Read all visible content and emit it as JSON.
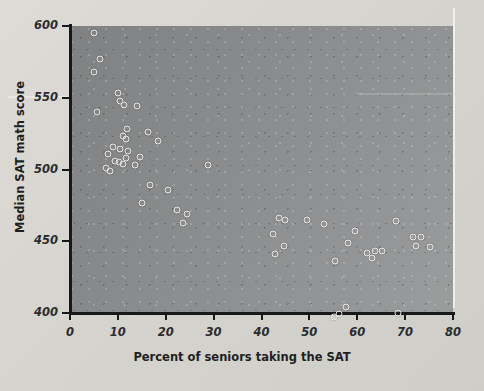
{
  "chart_data": {
    "type": "scatter",
    "title": "",
    "xlabel": "Percent of seniors taking the SAT",
    "ylabel": "Median SAT math score",
    "xlim": [
      0,
      80
    ],
    "ylim": [
      385,
      600
    ],
    "xticks": [
      0,
      10,
      20,
      30,
      40,
      50,
      60,
      70,
      80
    ],
    "yticks": [
      400,
      450,
      500,
      550,
      600
    ],
    "grid": false,
    "legend": null,
    "marker": "open-circle",
    "marker_color": "#eceae4",
    "plot_background": "#8b8d8e",
    "page_background": "#d9d9d6",
    "axis_color": "#16181a",
    "points": [
      {
        "x": 5.0,
        "y": 595
      },
      {
        "x": 6.3,
        "y": 577
      },
      {
        "x": 5.1,
        "y": 568
      },
      {
        "x": 10.0,
        "y": 553
      },
      {
        "x": 10.4,
        "y": 548
      },
      {
        "x": 11.2,
        "y": 545
      },
      {
        "x": 14.0,
        "y": 544
      },
      {
        "x": 5.6,
        "y": 540
      },
      {
        "x": 12.0,
        "y": 528
      },
      {
        "x": 16.3,
        "y": 526
      },
      {
        "x": 11.0,
        "y": 523
      },
      {
        "x": 11.6,
        "y": 521
      },
      {
        "x": 18.4,
        "y": 520
      },
      {
        "x": 9.0,
        "y": 516
      },
      {
        "x": 10.4,
        "y": 514
      },
      {
        "x": 12.2,
        "y": 513
      },
      {
        "x": 8.0,
        "y": 511
      },
      {
        "x": 11.8,
        "y": 508
      },
      {
        "x": 9.4,
        "y": 506
      },
      {
        "x": 10.3,
        "y": 505
      },
      {
        "x": 11.1,
        "y": 504
      },
      {
        "x": 14.6,
        "y": 509
      },
      {
        "x": 7.6,
        "y": 501
      },
      {
        "x": 8.3,
        "y": 499
      },
      {
        "x": 13.6,
        "y": 503
      },
      {
        "x": 28.8,
        "y": 503
      },
      {
        "x": 16.8,
        "y": 489
      },
      {
        "x": 20.4,
        "y": 486
      },
      {
        "x": 15.0,
        "y": 477
      },
      {
        "x": 22.3,
        "y": 472
      },
      {
        "x": 24.4,
        "y": 469
      },
      {
        "x": 23.6,
        "y": 463
      },
      {
        "x": 43.6,
        "y": 466
      },
      {
        "x": 45.0,
        "y": 465
      },
      {
        "x": 49.6,
        "y": 465
      },
      {
        "x": 53.0,
        "y": 462
      },
      {
        "x": 68.0,
        "y": 464
      },
      {
        "x": 42.4,
        "y": 455
      },
      {
        "x": 59.6,
        "y": 457
      },
      {
        "x": 71.6,
        "y": 453
      },
      {
        "x": 73.4,
        "y": 453
      },
      {
        "x": 58.0,
        "y": 449
      },
      {
        "x": 44.6,
        "y": 447
      },
      {
        "x": 72.2,
        "y": 447
      },
      {
        "x": 75.2,
        "y": 446
      },
      {
        "x": 62.0,
        "y": 442
      },
      {
        "x": 63.8,
        "y": 443
      },
      {
        "x": 65.2,
        "y": 443
      },
      {
        "x": 42.8,
        "y": 441
      },
      {
        "x": 63.0,
        "y": 438
      },
      {
        "x": 55.4,
        "y": 436
      },
      {
        "x": 57.6,
        "y": 404
      },
      {
        "x": 55.2,
        "y": 397
      },
      {
        "x": 56.2,
        "y": 399
      },
      {
        "x": 68.6,
        "y": 400
      }
    ]
  }
}
